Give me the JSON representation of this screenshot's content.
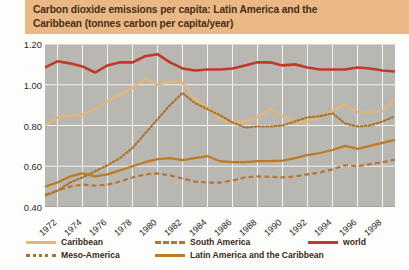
{
  "title": {
    "line1": "Carbon dioxide emissions per capita: Latin America and the",
    "line2": "Caribbean (tonnes carbon per capita/year)"
  },
  "colors": {
    "banner": "#e9b884",
    "plot_background": "#b9b7b2",
    "gridline": "#f2f2ee",
    "caribbean": "#e3b677",
    "meso_america": "#a9742c",
    "south_america": "#b4763a",
    "latin_america": "#bf7a23",
    "world": "#c0392b",
    "text": "#3a2a18"
  },
  "legend": {
    "position": "below-axis",
    "items": [
      {
        "label": "Caribbean",
        "style": "solid",
        "color": "#e3b677"
      },
      {
        "label": "Meso-America",
        "style": "dotted",
        "color": "#a9742c"
      },
      {
        "label": "South America",
        "style": "dashed",
        "color": "#b4763a"
      },
      {
        "label": "Latin America and the Caribbean",
        "style": "solid",
        "color": "#bf7a23"
      },
      {
        "label": "world",
        "style": "solid",
        "color": "#c0392b"
      }
    ]
  },
  "chart_data": {
    "type": "line",
    "title": "Carbon dioxide emissions per capita: Latin America and the Caribbean (tonnes carbon per capita/year)",
    "xlabel": "",
    "ylabel": "tonnes carbon per capita/year",
    "ylim": [
      0.4,
      1.2
    ],
    "yticks": [
      0.4,
      0.6,
      0.8,
      1.0,
      1.2
    ],
    "ytick_labels": [
      "0.40",
      "0.60",
      "0.80",
      "1.00",
      "1.20"
    ],
    "xlim": [
      1971,
      1999
    ],
    "grid": true,
    "x": [
      1971,
      1972,
      1973,
      1974,
      1975,
      1976,
      1977,
      1978,
      1979,
      1980,
      1981,
      1982,
      1983,
      1984,
      1985,
      1986,
      1987,
      1988,
      1989,
      1990,
      1991,
      1992,
      1993,
      1994,
      1995,
      1996,
      1997,
      1998,
      1999
    ],
    "xtick_values": [
      1972,
      1974,
      1976,
      1978,
      1980,
      1982,
      1984,
      1986,
      1988,
      1990,
      1992,
      1994,
      1996,
      1998
    ],
    "xtick_labels": [
      "1972",
      "1974",
      "1976",
      "1978",
      "1980",
      "1982",
      "1984",
      "1986",
      "1988",
      "1990",
      "1992",
      "1994",
      "1996",
      "1998"
    ],
    "series": [
      {
        "name": "world",
        "color": "#c0392b",
        "style": "solid",
        "values": [
          1.085,
          1.115,
          1.105,
          1.09,
          1.06,
          1.095,
          1.11,
          1.11,
          1.14,
          1.15,
          1.11,
          1.08,
          1.07,
          1.075,
          1.075,
          1.08,
          1.095,
          1.11,
          1.11,
          1.095,
          1.1,
          1.085,
          1.075,
          1.075,
          1.075,
          1.085,
          1.08,
          1.07,
          1.065
        ]
      },
      {
        "name": "Caribbean",
        "color": "#e3b677",
        "style": "solid",
        "values": [
          0.8,
          0.84,
          0.845,
          0.855,
          0.88,
          0.92,
          0.95,
          0.985,
          1.03,
          1.0,
          1.015,
          1.01,
          0.93,
          0.89,
          0.835,
          0.815,
          0.82,
          0.84,
          0.88,
          0.845,
          0.815,
          0.82,
          0.84,
          0.87,
          0.905,
          0.865,
          0.865,
          0.87,
          0.93
        ]
      },
      {
        "name": "Meso-America",
        "color": "#a9742c",
        "style": "dotted",
        "values": [
          0.455,
          0.48,
          0.52,
          0.545,
          0.575,
          0.605,
          0.64,
          0.69,
          0.76,
          0.83,
          0.9,
          0.96,
          0.91,
          0.88,
          0.85,
          0.815,
          0.79,
          0.795,
          0.795,
          0.8,
          0.82,
          0.84,
          0.845,
          0.86,
          0.81,
          0.795,
          0.8,
          0.82,
          0.845
        ]
      },
      {
        "name": "Latin America and the Caribbean",
        "color": "#bf7a23",
        "style": "solid",
        "values": [
          0.5,
          0.52,
          0.55,
          0.565,
          0.55,
          0.56,
          0.58,
          0.6,
          0.62,
          0.635,
          0.64,
          0.63,
          0.64,
          0.65,
          0.625,
          0.62,
          0.62,
          0.625,
          0.625,
          0.628,
          0.64,
          0.655,
          0.665,
          0.68,
          0.7,
          0.685,
          0.7,
          0.715,
          0.73
        ]
      },
      {
        "name": "South America",
        "color": "#b4763a",
        "style": "dashed",
        "values": [
          0.46,
          0.48,
          0.5,
          0.51,
          0.505,
          0.51,
          0.525,
          0.545,
          0.56,
          0.565,
          0.555,
          0.54,
          0.525,
          0.52,
          0.52,
          0.53,
          0.545,
          0.55,
          0.548,
          0.545,
          0.55,
          0.56,
          0.57,
          0.585,
          0.605,
          0.6,
          0.61,
          0.62,
          0.633
        ]
      }
    ]
  }
}
